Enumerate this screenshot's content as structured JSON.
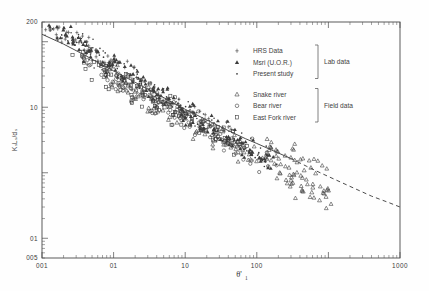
{
  "chart_data": {
    "type": "scatter",
    "title": "",
    "xlabel": "θ'",
    "xlabel_sub": "1",
    "ylabel": "Kₛ Lₛ / dₛ",
    "xscale": "log",
    "yscale": "log",
    "xlim": [
      0.01,
      1000
    ],
    "ylim": [
      0.05,
      200
    ],
    "grid": false,
    "legend_position": "upper-right-inside",
    "x_ticks": [
      "001",
      "01",
      "10",
      "100",
      "1000"
    ],
    "x_tick_values": [
      0.01,
      0.1,
      1.0,
      10.0,
      1000
    ],
    "x_tick_labels_display": [
      "0.01",
      "0.1",
      "1.0",
      "10.0",
      "100.0",
      "1000"
    ],
    "y_ticks": [
      "200",
      "10",
      "01",
      "005"
    ],
    "y_tick_values": [
      200,
      10,
      0.1,
      0.05
    ],
    "series": [
      {
        "name": "HRS Data",
        "marker": "cross",
        "group": "Lab data",
        "points": [
          [
            0.012,
            170
          ],
          [
            0.014,
            150
          ],
          [
            0.017,
            139
          ],
          [
            0.02,
            120
          ],
          [
            0.022,
            112
          ],
          [
            0.026,
            105
          ],
          [
            0.03,
            96
          ],
          [
            0.034,
            88
          ],
          [
            0.04,
            80
          ],
          [
            0.045,
            74
          ],
          [
            0.05,
            69
          ],
          [
            0.058,
            62
          ],
          [
            0.066,
            57
          ],
          [
            0.075,
            52
          ],
          [
            0.085,
            47
          ],
          [
            0.1,
            42
          ],
          [
            0.115,
            38
          ],
          [
            0.13,
            35
          ],
          [
            0.15,
            31
          ],
          [
            0.17,
            28
          ],
          [
            0.2,
            25
          ],
          [
            0.23,
            23
          ],
          [
            0.27,
            20.5
          ],
          [
            0.32,
            18
          ],
          [
            0.38,
            16
          ],
          [
            0.45,
            14
          ],
          [
            0.52,
            12.6
          ],
          [
            0.62,
            11.2
          ],
          [
            0.72,
            10
          ],
          [
            0.85,
            9
          ],
          [
            1.0,
            8.1
          ],
          [
            1.2,
            7.2
          ],
          [
            1.45,
            6.4
          ],
          [
            1.7,
            5.8
          ],
          [
            2.0,
            5.2
          ],
          [
            2.4,
            4.6
          ],
          [
            2.9,
            4.1
          ],
          [
            3.4,
            3.7
          ],
          [
            4.1,
            3.3
          ],
          [
            4.9,
            2.9
          ]
        ]
      },
      {
        "name": "Msri (U.O.R.)",
        "marker": "filled-triangle",
        "group": "Lab data",
        "points": [
          [
            0.013,
            160
          ],
          [
            0.016,
            142
          ],
          [
            0.019,
            128
          ],
          [
            0.023,
            115
          ],
          [
            0.027,
            104
          ],
          [
            0.031,
            95
          ],
          [
            0.036,
            87
          ],
          [
            0.042,
            79
          ],
          [
            0.048,
            72
          ],
          [
            0.055,
            66
          ],
          [
            0.063,
            60
          ],
          [
            0.072,
            55
          ],
          [
            0.082,
            50
          ],
          [
            0.094,
            46
          ],
          [
            0.108,
            42
          ],
          [
            0.124,
            38
          ],
          [
            0.142,
            35
          ],
          [
            0.163,
            32
          ],
          [
            0.187,
            29
          ],
          [
            0.215,
            26
          ],
          [
            0.247,
            24
          ],
          [
            0.283,
            21.5
          ],
          [
            0.325,
            19.5
          ],
          [
            0.373,
            17.5
          ],
          [
            0.428,
            16
          ],
          [
            0.491,
            14.5
          ],
          [
            0.564,
            13
          ],
          [
            0.647,
            12
          ],
          [
            0.743,
            10.8
          ],
          [
            0.853,
            9.8
          ],
          [
            0.979,
            8.9
          ],
          [
            1.124,
            8.1
          ],
          [
            1.29,
            7.4
          ],
          [
            1.48,
            6.7
          ],
          [
            1.7,
            6.1
          ],
          [
            1.95,
            5.6
          ],
          [
            2.24,
            5.1
          ],
          [
            2.57,
            4.6
          ],
          [
            2.95,
            4.2
          ],
          [
            3.39,
            3.8
          ],
          [
            3.89,
            3.5
          ],
          [
            4.47,
            3.2
          ],
          [
            5.13,
            2.9
          ],
          [
            5.89,
            2.6
          ],
          [
            6.76,
            2.4
          ],
          [
            7.76,
            2.2
          ],
          [
            8.91,
            2.0
          ],
          [
            10.2,
            1.85
          ],
          [
            11.7,
            1.7
          ],
          [
            13.5,
            1.55
          ]
        ]
      },
      {
        "name": "Present study",
        "marker": "dot",
        "group": "Lab data",
        "points": [
          [
            0.015,
            145
          ],
          [
            0.018,
            132
          ],
          [
            0.021,
            122
          ],
          [
            0.025,
            110
          ],
          [
            0.029,
            100
          ],
          [
            0.033,
            92
          ],
          [
            0.038,
            85
          ],
          [
            0.044,
            77
          ],
          [
            0.051,
            70
          ],
          [
            0.059,
            64
          ],
          [
            0.068,
            58
          ],
          [
            0.078,
            53
          ],
          [
            0.09,
            48
          ],
          [
            0.103,
            44
          ],
          [
            0.119,
            40
          ],
          [
            0.137,
            36
          ],
          [
            0.157,
            33
          ],
          [
            0.181,
            30
          ],
          [
            0.208,
            27
          ],
          [
            0.239,
            24.5
          ],
          [
            0.275,
            22
          ],
          [
            0.316,
            20
          ],
          [
            0.364,
            18
          ],
          [
            0.418,
            16.5
          ],
          [
            0.481,
            15
          ],
          [
            0.553,
            13.5
          ],
          [
            0.636,
            12.2
          ],
          [
            0.732,
            11
          ],
          [
            0.841,
            10
          ],
          [
            0.967,
            9.1
          ],
          [
            1.11,
            8.3
          ],
          [
            1.28,
            7.5
          ],
          [
            1.47,
            6.8
          ],
          [
            1.69,
            6.2
          ],
          [
            1.95,
            5.7
          ],
          [
            2.24,
            5.2
          ],
          [
            2.57,
            4.7
          ],
          [
            2.96,
            4.3
          ],
          [
            3.4,
            3.9
          ],
          [
            3.91,
            3.6
          ],
          [
            4.5,
            3.3
          ],
          [
            5.17,
            3.0
          ],
          [
            5.95,
            2.75
          ],
          [
            6.84,
            2.5
          ],
          [
            7.86,
            2.3
          ],
          [
            9.04,
            2.1
          ],
          [
            10.4,
            1.95
          ],
          [
            12.0,
            1.8
          ],
          [
            13.8,
            1.65
          ],
          [
            15.8,
            1.5
          ]
        ]
      },
      {
        "name": "Snake river",
        "marker": "open-triangle",
        "group": "Field data",
        "points": [
          [
            0.08,
            30
          ],
          [
            0.1,
            27
          ],
          [
            0.13,
            23
          ],
          [
            0.16,
            20
          ],
          [
            0.2,
            17.5
          ],
          [
            0.25,
            15
          ],
          [
            0.3,
            13
          ],
          [
            0.38,
            11.5
          ],
          [
            0.46,
            10
          ],
          [
            0.56,
            9
          ],
          [
            0.68,
            8
          ],
          [
            0.83,
            7
          ],
          [
            1.0,
            6.3
          ],
          [
            1.2,
            5.6
          ],
          [
            1.5,
            5.0
          ],
          [
            1.8,
            4.5
          ],
          [
            2.2,
            4.0
          ],
          [
            2.7,
            3.6
          ],
          [
            3.3,
            3.2
          ],
          [
            4.0,
            2.9
          ],
          [
            4.9,
            2.6
          ],
          [
            6.0,
            2.3
          ],
          [
            7.3,
            2.1
          ],
          [
            8.9,
            1.9
          ],
          [
            10.8,
            1.7
          ],
          [
            13.2,
            1.5
          ],
          [
            16.1,
            1.35
          ],
          [
            19.6,
            1.2
          ],
          [
            24.0,
            1.1
          ],
          [
            29.2,
            0.98
          ],
          [
            35.6,
            0.88
          ],
          [
            43.4,
            0.78
          ],
          [
            52.9,
            0.7
          ],
          [
            64.6,
            0.62
          ],
          [
            78.8,
            0.55
          ],
          [
            96.0,
            0.48
          ],
          [
            32,
            1.6
          ],
          [
            45,
            1.3
          ],
          [
            58,
            1.15
          ],
          [
            70,
            0.95
          ],
          [
            25,
            1.9
          ],
          [
            38,
            1.45
          ],
          [
            20,
            2.2
          ],
          [
            15,
            2.5
          ],
          [
            12,
            2.8
          ],
          [
            85,
            0.42
          ],
          [
            62,
            0.5
          ],
          [
            48,
            0.6
          ],
          [
            36,
            0.72
          ],
          [
            28,
            0.85
          ]
        ]
      },
      {
        "name": "Bear river",
        "marker": "circle",
        "group": "Field data",
        "points": [
          [
            0.05,
            42
          ],
          [
            0.065,
            36
          ],
          [
            0.08,
            31
          ],
          [
            0.1,
            27
          ],
          [
            0.125,
            23
          ],
          [
            0.155,
            20
          ],
          [
            0.19,
            17.5
          ],
          [
            0.24,
            15
          ],
          [
            0.3,
            13
          ],
          [
            0.37,
            11.5
          ],
          [
            0.46,
            10
          ],
          [
            0.57,
            8.8
          ],
          [
            0.71,
            7.8
          ],
          [
            0.88,
            6.9
          ],
          [
            1.1,
            6.1
          ],
          [
            1.35,
            5.4
          ],
          [
            1.68,
            4.8
          ],
          [
            2.08,
            4.3
          ],
          [
            2.58,
            3.8
          ],
          [
            3.2,
            3.4
          ],
          [
            3.97,
            3.05
          ],
          [
            4.93,
            2.7
          ],
          [
            6.11,
            2.4
          ],
          [
            7.58,
            2.15
          ],
          [
            9.4,
            1.9
          ],
          [
            11.7,
            1.7
          ],
          [
            14.5,
            1.5
          ],
          [
            0.09,
            24
          ],
          [
            0.14,
            19
          ],
          [
            0.22,
            15.5
          ],
          [
            0.34,
            12.5
          ],
          [
            0.52,
            10.5
          ],
          [
            0.8,
            8.5
          ],
          [
            1.25,
            7.0
          ]
        ]
      },
      {
        "name": "East Fork river",
        "marker": "square",
        "group": "Field data",
        "points": [
          [
            0.03,
            62
          ],
          [
            0.04,
            53
          ],
          [
            0.05,
            46
          ],
          [
            0.065,
            39
          ],
          [
            0.08,
            34
          ],
          [
            0.1,
            29
          ],
          [
            0.125,
            25
          ],
          [
            0.155,
            22
          ],
          [
            0.19,
            19
          ],
          [
            0.24,
            16.5
          ],
          [
            0.3,
            14.5
          ],
          [
            0.37,
            12.8
          ],
          [
            0.46,
            11.3
          ],
          [
            0.57,
            10
          ],
          [
            0.71,
            8.8
          ],
          [
            0.88,
            7.8
          ],
          [
            1.1,
            6.9
          ],
          [
            1.35,
            6.1
          ],
          [
            1.68,
            5.4
          ],
          [
            2.08,
            4.8
          ],
          [
            2.58,
            4.3
          ],
          [
            3.2,
            3.8
          ],
          [
            3.97,
            3.4
          ],
          [
            4.93,
            3.0
          ],
          [
            6.11,
            2.7
          ],
          [
            0.06,
            36
          ],
          [
            0.11,
            26
          ],
          [
            0.18,
            20.5
          ],
          [
            0.28,
            16
          ],
          [
            0.44,
            12.5
          ]
        ]
      }
    ],
    "fit_curve": {
      "name": "fitted curve",
      "style_solid_range": [
        0.01,
        30
      ],
      "style_dashed_range": [
        30,
        1000
      ],
      "points": [
        [
          0.01,
          130
        ],
        [
          0.02,
          92
        ],
        [
          0.04,
          62
        ],
        [
          0.07,
          44
        ],
        [
          0.1,
          36
        ],
        [
          0.2,
          24
        ],
        [
          0.4,
          16
        ],
        [
          0.7,
          11.5
        ],
        [
          1.0,
          9.3
        ],
        [
          2.0,
          6.4
        ],
        [
          4.0,
          4.4
        ],
        [
          7.0,
          3.3
        ],
        [
          10.0,
          2.8
        ],
        [
          20.0,
          2.0
        ],
        [
          30.0,
          1.65
        ],
        [
          50.0,
          1.25
        ],
        [
          80.0,
          0.98
        ],
        [
          120.0,
          0.8
        ],
        [
          200.0,
          0.62
        ],
        [
          400.0,
          0.44
        ],
        [
          700.0,
          0.35
        ],
        [
          1000.0,
          0.3
        ]
      ]
    }
  },
  "legend": {
    "groups": [
      {
        "label": "Lab data",
        "entries": [
          {
            "label": "HRS Data",
            "marker": "cross"
          },
          {
            "label": "Msri (U.O.R.)",
            "marker": "filled-triangle"
          },
          {
            "label": "Present study",
            "marker": "dot"
          }
        ]
      },
      {
        "label": "Field data",
        "entries": [
          {
            "label": "Snake river",
            "marker": "open-triangle"
          },
          {
            "label": "Bear river",
            "marker": "circle"
          },
          {
            "label": "East Fork river",
            "marker": "square"
          }
        ]
      }
    ]
  },
  "axes": {
    "x_title_main": "θ'",
    "x_title_sub": "1",
    "y_title": "KₛLₛ/dₛ",
    "x_labels": [
      {
        "text": "001",
        "value": 0.01
      },
      {
        "text": "01",
        "value": 0.1
      },
      {
        "text": "10",
        "value": 1.0
      },
      {
        "text": "100",
        "value": 10.0
      },
      {
        "text": "1000",
        "value": 1000
      }
    ],
    "y_labels": [
      {
        "text": "200",
        "value": 200
      },
      {
        "text": "10",
        "value": 10
      },
      {
        "text": "01",
        "value": 0.1
      },
      {
        "text": "005",
        "value": 0.05
      }
    ]
  },
  "colors": {
    "background": "#fefefe",
    "axis": "#4a4a4a",
    "marker": "#3c3c3c",
    "curve": "#4c4c4c",
    "text": "#3f3f3f"
  }
}
